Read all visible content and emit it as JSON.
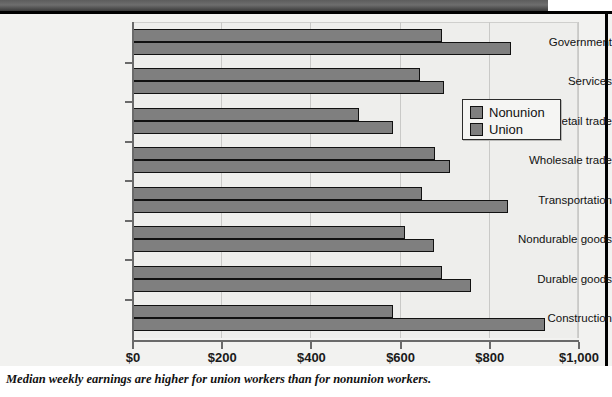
{
  "caption": "Median weekly earnings are higher for union workers than for nonunion workers.",
  "legend": {
    "items": [
      {
        "label": "Nonunion",
        "color": "#7f7f7f"
      },
      {
        "label": "Union",
        "color": "#7f7f7f"
      }
    ]
  },
  "axis": {
    "x_ticklabels": [
      "$0",
      "$200",
      "$400",
      "$600",
      "$800",
      "$1,000"
    ],
    "x_tickvalues": [
      0,
      200,
      400,
      600,
      800,
      1000
    ]
  },
  "chart_data": {
    "type": "bar",
    "orientation": "horizontal",
    "title": "",
    "xlabel": "",
    "ylabel": "",
    "xlim": [
      0,
      1000
    ],
    "grid": true,
    "legend_position": "upper-right-inside",
    "categories": [
      "Government",
      "Services",
      "Retail trade",
      "Wholesale trade",
      "Transportation",
      "Nondurable goods",
      "Durable goods",
      "Construction"
    ],
    "series": [
      {
        "name": "Nonunion",
        "color": "#7f7f7f",
        "values": [
          695,
          645,
          510,
          680,
          650,
          612,
          695,
          585
        ]
      },
      {
        "name": "Union",
        "color": "#7f7f7f",
        "values": [
          850,
          700,
          585,
          713,
          843,
          677,
          760,
          926
        ]
      }
    ]
  }
}
